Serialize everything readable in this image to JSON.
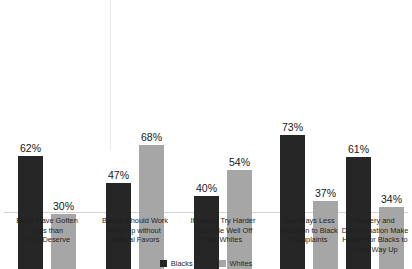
{
  "chart_data": {
    "type": "bar",
    "title": "",
    "subtitle": "",
    "xlabel": "",
    "ylabel": "",
    "ylim": [
      0,
      100
    ],
    "grid": false,
    "legend_position": "bottom",
    "value_suffix": "%",
    "categories": [
      "Black Have Gotten Less than They Deserve",
      "Blacks Should Work Way Up without Special Favors",
      "If Blacks Try Harder Could Be Well Off Like Whites",
      "Gov. Pays Less Attention to Black Complaints",
      "Slavery and Discrimination Make Harder for Blacks to Work Way Up"
    ],
    "category_lines": [
      [
        "Black Have Gotten",
        "Less than",
        "They Deserve"
      ],
      [
        "Blacks Should Work",
        "Way Up without",
        "Special Favors"
      ],
      [
        "If Blacks Try Harder",
        "Could Be Well Off",
        "Like Whites"
      ],
      [
        "Gov. Pays Less",
        "Attention to Black",
        "Complaints"
      ],
      [
        "Slavery and",
        "Discrimination Make",
        "Harder for Blacks to",
        "Work Way Up"
      ]
    ],
    "series": [
      {
        "name": "Blacks",
        "color": "#262626",
        "values": [
          62,
          47,
          40,
          73,
          61
        ],
        "labels": [
          "62%",
          "47%",
          "40%",
          "73%",
          "61%"
        ]
      },
      {
        "name": "Whites",
        "color": "#a6a6a6",
        "values": [
          30,
          68,
          54,
          37,
          34
        ],
        "labels": [
          "30%",
          "68%",
          "54%",
          "37%",
          "34%"
        ]
      }
    ]
  },
  "colors": {
    "background": "#ffffff",
    "series_dark": "#262626",
    "series_light": "#a6a6a6",
    "axis_line": "#d2d2d2",
    "text": "#1f1f1f"
  }
}
